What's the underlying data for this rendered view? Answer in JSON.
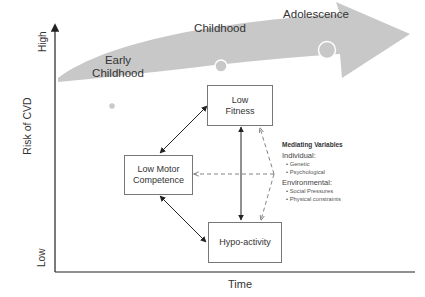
{
  "diagram": {
    "axes": {
      "y_label": "Risk of CVD",
      "y_high": "High",
      "y_low": "Low",
      "x_label": "Time"
    },
    "stages": [
      {
        "label_line1": "Early",
        "label_line2": "Childhood"
      },
      {
        "label": "Childhood"
      },
      {
        "label": "Adolescence"
      }
    ],
    "boxes": {
      "low_fitness": {
        "line1": "Low",
        "line2": "Fitness"
      },
      "low_motor_competence": {
        "line1": "Low Motor",
        "line2": "Competence"
      },
      "hypo_activity": {
        "label": "Hypo-activity"
      }
    },
    "mediating_variables": {
      "title": "Mediating Variables",
      "categories": [
        {
          "name": "Individual:",
          "items": [
            "Genetic",
            "Psychological"
          ]
        },
        {
          "name": "Environmental:",
          "items": [
            "Social Pressures",
            "Physical constraints"
          ]
        }
      ]
    },
    "colors": {
      "band": "#c8c8c8",
      "axis": "#222222",
      "box_border": "#777777",
      "dashed_arrow": "#777777"
    }
  }
}
